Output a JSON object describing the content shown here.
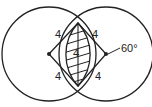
{
  "diagram": {
    "type": "geometry",
    "circles": [
      {
        "name": "left-circle",
        "cx": 49,
        "cy": 54,
        "r": 47
      },
      {
        "name": "right-circle",
        "cx": 106,
        "cy": 54,
        "r": 47
      }
    ],
    "labels": {
      "side_top_left": "4",
      "side_top_right": "4",
      "side_bottom_left": "4",
      "side_bottom_right": "4",
      "chord": "4",
      "angle": "60°"
    },
    "colors": {
      "stroke": "#222222",
      "background": "#ffffff"
    }
  }
}
